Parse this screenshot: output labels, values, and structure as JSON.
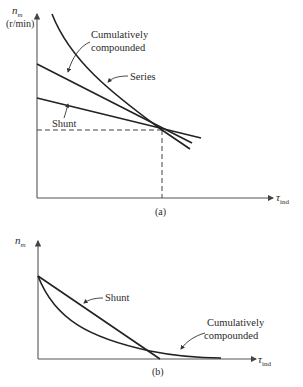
{
  "figure": {
    "panel_a": {
      "caption": "(a)",
      "y_axis_label_main": "n",
      "y_axis_label_sub": "m",
      "y_axis_unit": "(r/min)",
      "x_axis_label_main": "τ",
      "x_axis_label_sub": "ind",
      "curves": {
        "series": "Series",
        "cumulative_line1": "Cumulatively",
        "cumulative_line2": "compounded",
        "shunt": "Shunt"
      }
    },
    "panel_b": {
      "caption": "(b)",
      "y_axis_label_main": "n",
      "y_axis_label_sub": "m",
      "x_axis_label_main": "τ",
      "x_axis_label_sub": "ind",
      "curves": {
        "shunt": "Shunt",
        "cumulative_line1": "Cumulatively",
        "cumulative_line2": "compounded"
      }
    }
  },
  "colors": {
    "curve": "#222222",
    "axis": "#555555",
    "background": "#ffffff"
  }
}
